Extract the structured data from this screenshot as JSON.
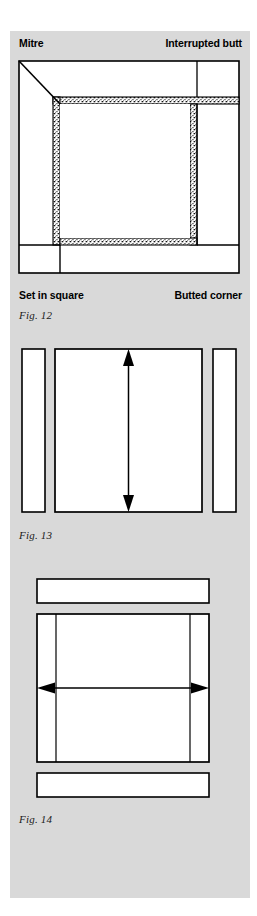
{
  "page": {
    "background_color": "#ffffff",
    "plate_color": "#d9d9d9",
    "line_color": "#000000",
    "fill_color": "#ffffff",
    "stipple_color": "#1a1a1a"
  },
  "figures": [
    {
      "id": "fig12",
      "caption": "Fig. 12",
      "type": "frame-corner-joints",
      "description": "Square frame showing four different corner joint treatments",
      "labels": {
        "top_left": "Mitre",
        "top_right": "Interrupted butt",
        "bottom_left": "Set in square",
        "bottom_right": "Butted corner"
      },
      "joint_names": [
        "Mitre",
        "Interrupted butt",
        "Set in square",
        "Butted corner"
      ]
    },
    {
      "id": "fig13",
      "caption": "Fig. 13",
      "type": "panel-with-vertical-dimension",
      "description": "Central panel with vertical double headed dimension arrow, flanked left and right by narrow vertical strips",
      "arrow_direction": "vertical",
      "side_strips": 2
    },
    {
      "id": "fig14",
      "caption": "Fig. 14",
      "type": "panel-with-horizontal-dimension",
      "description": "Central panel with two vertical division lines and a horizontal double headed dimension arrow, flanked above and below by horizontal strips",
      "arrow_direction": "horizontal",
      "side_strips": 2
    }
  ]
}
